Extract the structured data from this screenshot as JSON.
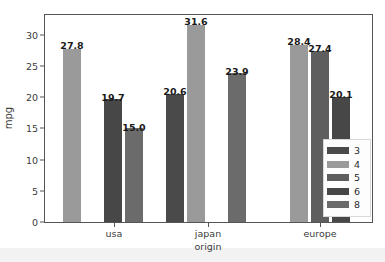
{
  "chart_data": {
    "type": "bar",
    "title": "",
    "xlabel": "origin",
    "ylabel": "mpg",
    "categories": [
      "usa",
      "japan",
      "europe"
    ],
    "legend_title": "",
    "legend_position": "lower right",
    "grid": false,
    "ylim": [
      0,
      33.2
    ],
    "yticks": [
      0,
      5,
      10,
      15,
      20,
      25,
      30
    ],
    "ytick_labels": [
      "0",
      "5",
      "10",
      "15",
      "20",
      "25",
      "30"
    ],
    "series": [
      {
        "name": "3",
        "color": "#4a4a4a",
        "values": [
          null,
          20.6,
          null
        ]
      },
      {
        "name": "4",
        "color": "#9a9a9a",
        "values": [
          27.8,
          31.6,
          28.4
        ]
      },
      {
        "name": "5",
        "color": "#5e5e5e",
        "values": [
          null,
          null,
          27.4
        ]
      },
      {
        "name": "6",
        "color": "#474747",
        "values": [
          19.7,
          null,
          20.1
        ]
      },
      {
        "name": "8",
        "color": "#6b6b6b",
        "values": [
          15.0,
          23.9,
          null
        ]
      }
    ],
    "bars": [
      {
        "group": "usa",
        "series": "4",
        "value": 27.8,
        "label": "27.8",
        "color": "#9a9a9a",
        "x": 63.0,
        "width": 18.0,
        "label_x": 72.0,
        "label_y": 40.0
      },
      {
        "group": "usa",
        "series": "6",
        "value": 19.7,
        "label": "19.7",
        "color": "#474747",
        "x": 104.0,
        "width": 18.0,
        "label_x": 113.0,
        "label_y": 92.0
      },
      {
        "group": "usa",
        "series": "8",
        "value": 15.0,
        "label": "15.0",
        "color": "#6b6b6b",
        "x": 125.0,
        "width": 18.0,
        "label_x": 134.0,
        "label_y": 122.0
      },
      {
        "group": "japan",
        "series": "3",
        "value": 20.6,
        "label": "20.6",
        "color": "#4a4a4a",
        "x": 166.0,
        "width": 18.0,
        "label_x": 175.0,
        "label_y": 86.0
      },
      {
        "group": "japan",
        "series": "4",
        "value": 31.6,
        "label": "31.6",
        "color": "#9a9a9a",
        "x": 187.0,
        "width": 18.0,
        "label_x": 196.0,
        "label_y": 16.0
      },
      {
        "group": "japan",
        "series": "8",
        "value": 23.9,
        "label": "23.9",
        "color": "#6b6b6b",
        "x": 228.0,
        "width": 18.0,
        "label_x": 237.0,
        "label_y": 66.0
      },
      {
        "group": "europe",
        "series": "4",
        "value": 28.4,
        "label": "28.4",
        "color": "#9a9a9a",
        "x": 290.0,
        "width": 18.0,
        "label_x": 299.0,
        "label_y": 36.0
      },
      {
        "group": "europe",
        "series": "5",
        "value": 27.4,
        "label": "27.4",
        "color": "#5e5e5e",
        "x": 311.0,
        "width": 18.0,
        "label_x": 320.0,
        "label_y": 43.0
      },
      {
        "group": "europe",
        "series": "6",
        "value": 20.1,
        "label": "20.1",
        "color": "#474747",
        "x": 332.0,
        "width": 18.0,
        "label_x": 341.0,
        "label_y": 89.0
      }
    ],
    "group_tick_x": [
      114.0,
      208.0,
      320.0
    ]
  }
}
